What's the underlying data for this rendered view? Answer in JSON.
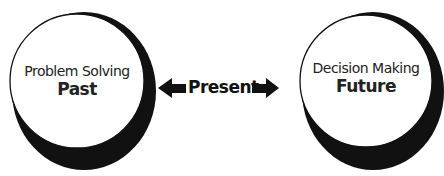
{
  "diagram": {
    "left": {
      "subtitle": "Problem Solving",
      "title": "Past"
    },
    "right": {
      "subtitle": "Decision Making",
      "title": "Future"
    },
    "center": {
      "label": "Present"
    },
    "colors": {
      "stroke": "#111111",
      "shadow": "#111111",
      "fill": "#ffffff"
    }
  }
}
